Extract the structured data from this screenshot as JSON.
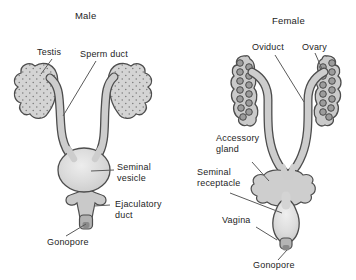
{
  "diagram": {
    "male": {
      "title": "Male",
      "labels": {
        "testis": "Testis",
        "sperm_duct": "Sperm duct",
        "seminal_vesicle": "Seminal vesicle",
        "ejaculatory_duct": "Ejaculatory duct",
        "gonopore": "Gonopore"
      }
    },
    "female": {
      "title": "Female",
      "labels": {
        "oviduct": "Oviduct",
        "ovary": "Ovary",
        "accessory_gland": "Accessory gland",
        "seminal_receptacle": "Seminal receptacle",
        "vagina": "Vagina",
        "gonopore": "Gonopore"
      }
    },
    "colors": {
      "background": "#ffffff",
      "organ_fill": "#d2d2d2",
      "organ_highlight": "#ececec",
      "outline": "#4d4d4d",
      "egg_fill": "#9c9c9c",
      "leader_line": "#5a5a5a",
      "text": "#242424"
    }
  }
}
